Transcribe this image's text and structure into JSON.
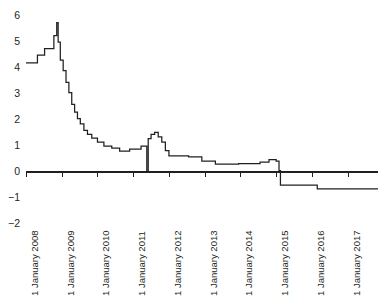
{
  "chart_data": {
    "type": "line",
    "title": "",
    "subtitle": "",
    "xlabel": "",
    "ylabel": "",
    "line_style": "step",
    "grid": false,
    "legend": null,
    "line_color": "#231f20",
    "axis_color": "#231f20",
    "xlim": [
      2008.0,
      2017.85
    ],
    "ylim": [
      -2,
      6
    ],
    "y_ticks": [
      6,
      5,
      4,
      3,
      2,
      1,
      0,
      -1,
      -2
    ],
    "y_tick_labels": [
      "6",
      "5",
      "4",
      "3",
      "2",
      "1",
      "0",
      "−1",
      "−2"
    ],
    "x_ticks": [
      2008,
      2009,
      2010,
      2011,
      2012,
      2013,
      2014,
      2015,
      2016,
      2017
    ],
    "x_tick_labels": [
      "1 January 2008",
      "1 January 2009",
      "1 January 2010",
      "1 January 2011",
      "1 January 2012",
      "1 January 2013",
      "1 January 2014",
      "1 January 2015",
      "1 January 2016",
      "1 January 2017"
    ],
    "zero_line": 0,
    "series": [
      {
        "name": "rate",
        "points": [
          [
            2008.0,
            4.2
          ],
          [
            2008.32,
            4.2
          ],
          [
            2008.32,
            4.5
          ],
          [
            2008.52,
            4.5
          ],
          [
            2008.52,
            4.75
          ],
          [
            2008.78,
            4.75
          ],
          [
            2008.78,
            5.25
          ],
          [
            2008.86,
            5.25
          ],
          [
            2008.86,
            5.75
          ],
          [
            2008.9,
            5.75
          ],
          [
            2008.9,
            5.0
          ],
          [
            2008.96,
            5.0
          ],
          [
            2008.96,
            4.3
          ],
          [
            2009.04,
            4.3
          ],
          [
            2009.04,
            3.9
          ],
          [
            2009.12,
            3.9
          ],
          [
            2009.12,
            3.45
          ],
          [
            2009.2,
            3.45
          ],
          [
            2009.2,
            3.05
          ],
          [
            2009.28,
            3.05
          ],
          [
            2009.28,
            2.6
          ],
          [
            2009.36,
            2.6
          ],
          [
            2009.36,
            2.3
          ],
          [
            2009.44,
            2.3
          ],
          [
            2009.44,
            2.05
          ],
          [
            2009.52,
            2.05
          ],
          [
            2009.52,
            1.85
          ],
          [
            2009.62,
            1.85
          ],
          [
            2009.62,
            1.6
          ],
          [
            2009.72,
            1.6
          ],
          [
            2009.72,
            1.45
          ],
          [
            2009.84,
            1.45
          ],
          [
            2009.84,
            1.3
          ],
          [
            2010.0,
            1.3
          ],
          [
            2010.0,
            1.15
          ],
          [
            2010.18,
            1.15
          ],
          [
            2010.18,
            1.0
          ],
          [
            2010.4,
            1.0
          ],
          [
            2010.4,
            0.92
          ],
          [
            2010.62,
            0.92
          ],
          [
            2010.62,
            0.8
          ],
          [
            2010.9,
            0.8
          ],
          [
            2010.9,
            0.88
          ],
          [
            2011.22,
            0.88
          ],
          [
            2011.22,
            1.0
          ],
          [
            2011.38,
            1.0
          ],
          [
            2011.38,
            0.0
          ],
          [
            2011.42,
            0.0
          ],
          [
            2011.42,
            1.28
          ],
          [
            2011.5,
            1.28
          ],
          [
            2011.5,
            1.45
          ],
          [
            2011.6,
            1.45
          ],
          [
            2011.6,
            1.52
          ],
          [
            2011.7,
            1.52
          ],
          [
            2011.7,
            1.35
          ],
          [
            2011.8,
            1.35
          ],
          [
            2011.8,
            1.15
          ],
          [
            2011.9,
            1.15
          ],
          [
            2011.9,
            0.82
          ],
          [
            2012.0,
            0.82
          ],
          [
            2012.0,
            0.62
          ],
          [
            2012.55,
            0.62
          ],
          [
            2012.55,
            0.58
          ],
          [
            2012.92,
            0.58
          ],
          [
            2012.92,
            0.42
          ],
          [
            2013.3,
            0.42
          ],
          [
            2013.3,
            0.3
          ],
          [
            2013.95,
            0.3
          ],
          [
            2013.95,
            0.32
          ],
          [
            2014.55,
            0.32
          ],
          [
            2014.55,
            0.38
          ],
          [
            2014.8,
            0.38
          ],
          [
            2014.8,
            0.48
          ],
          [
            2015.0,
            0.48
          ],
          [
            2015.0,
            0.42
          ],
          [
            2015.08,
            0.42
          ],
          [
            2015.08,
            0.05
          ],
          [
            2015.12,
            0.05
          ],
          [
            2015.12,
            -0.5
          ],
          [
            2016.15,
            -0.5
          ],
          [
            2016.15,
            -0.65
          ],
          [
            2017.85,
            -0.65
          ]
        ]
      }
    ]
  }
}
